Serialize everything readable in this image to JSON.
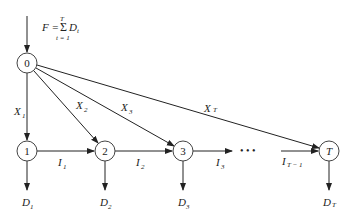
{
  "formula": {
    "lhs": "F =",
    "sigma": "Σ",
    "term": "D",
    "term_sub": "t",
    "upper": "T",
    "lower": "t = 1"
  },
  "nodes": [
    {
      "id": "0",
      "label": "0",
      "x": 27,
      "y": 63,
      "italic": false
    },
    {
      "id": "1",
      "label": "1",
      "x": 27,
      "y": 151,
      "italic": false
    },
    {
      "id": "2",
      "label": "2",
      "x": 105,
      "y": 151,
      "italic": false
    },
    {
      "id": "3",
      "label": "3",
      "x": 183,
      "y": 151,
      "italic": false
    },
    {
      "id": "T",
      "label": "T",
      "x": 329,
      "y": 151,
      "italic": true
    }
  ],
  "supply_edges": [
    {
      "label": "X",
      "sub": "1"
    },
    {
      "label": "X",
      "sub": "2"
    },
    {
      "label": "X",
      "sub": "3"
    },
    {
      "label": "X",
      "sub": "T"
    }
  ],
  "inventory_edges": [
    {
      "label": "I",
      "sub": "1"
    },
    {
      "label": "I",
      "sub": "2"
    },
    {
      "label": "I",
      "sub": "3"
    },
    {
      "label": "I",
      "sub": "T − 1"
    }
  ],
  "demand_edges": [
    {
      "label": "D",
      "sub": "1"
    },
    {
      "label": "D",
      "sub": "2"
    },
    {
      "label": "D",
      "sub": "3"
    },
    {
      "label": "D",
      "sub": "T"
    }
  ],
  "ellipsis": "• • •"
}
